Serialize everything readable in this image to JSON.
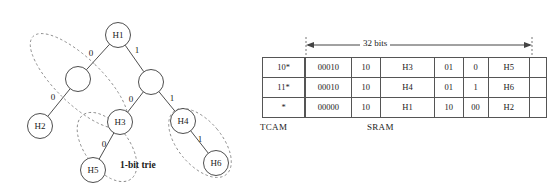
{
  "figure": {
    "trie": {
      "caption": "1-bit trie",
      "nodes": [
        {
          "id": "root",
          "label": "H1",
          "cx": 118,
          "cy": 35,
          "r": 12.5,
          "labeled": true
        },
        {
          "id": "n-l",
          "label": "",
          "cx": 78,
          "cy": 79,
          "r": 12.5,
          "labeled": false
        },
        {
          "id": "n-r",
          "label": "",
          "cx": 151,
          "cy": 82,
          "r": 12.5,
          "labeled": false
        },
        {
          "id": "h2",
          "label": "H2",
          "cx": 40,
          "cy": 126,
          "r": 12.5,
          "labeled": true
        },
        {
          "id": "h3",
          "label": "H3",
          "cx": 120,
          "cy": 122,
          "r": 12.5,
          "labeled": true
        },
        {
          "id": "h4",
          "label": "H4",
          "cx": 183,
          "cy": 121,
          "r": 12.5,
          "labeled": true
        },
        {
          "id": "h5",
          "label": "H5",
          "cx": 93,
          "cy": 170,
          "r": 12.5,
          "labeled": true
        },
        {
          "id": "h6",
          "label": "H6",
          "cx": 216,
          "cy": 163,
          "r": 12.5,
          "labeled": true
        }
      ],
      "edges": [
        {
          "from": "root",
          "to": "n-l",
          "bit": "0",
          "lx": 91,
          "ly": 56
        },
        {
          "from": "root",
          "to": "n-r",
          "bit": "1",
          "lx": 137,
          "ly": 53
        },
        {
          "from": "n-l",
          "to": "h2",
          "bit": "0",
          "lx": 53,
          "ly": 100
        },
        {
          "from": "n-r",
          "to": "h3",
          "bit": "0",
          "lx": 131,
          "ly": 102
        },
        {
          "from": "n-r",
          "to": "h4",
          "bit": "1",
          "lx": 172,
          "ly": 101
        },
        {
          "from": "h3",
          "to": "h5",
          "bit": "0",
          "lx": 104,
          "ly": 147
        },
        {
          "from": "h4",
          "to": "h6",
          "bit": "1",
          "lx": 200,
          "ly": 142
        }
      ],
      "groups": [
        {
          "id": "group-h1-h2",
          "cx": 79,
          "cy": 81,
          "rx": 23,
          "ry": 64,
          "rot": -46
        },
        {
          "id": "group-h3-h5",
          "cx": 107,
          "cy": 147,
          "rx": 22,
          "ry": 40,
          "rot": -37
        },
        {
          "id": "group-h4-h6",
          "cx": 200,
          "cy": 143,
          "rx": 22,
          "ry": 41,
          "rot": -40
        }
      ]
    },
    "memory": {
      "width_annotation": "32 bits",
      "tcam": {
        "label": "TCAM",
        "rows": [
          [
            "10*"
          ],
          [
            "11*"
          ],
          [
            "*"
          ]
        ]
      },
      "sram": {
        "label": "SRAM",
        "col_widths": [
          44,
          27,
          56,
          26,
          22,
          41,
          14
        ],
        "rows": [
          [
            "00010",
            "10",
            "H3",
            "01",
            "0",
            "H5",
            ""
          ],
          [
            "00010",
            "10",
            "H4",
            "01",
            "1",
            "H6",
            ""
          ],
          [
            "00000",
            "10",
            "H1",
            "10",
            "00",
            "H2",
            ""
          ]
        ]
      }
    }
  }
}
